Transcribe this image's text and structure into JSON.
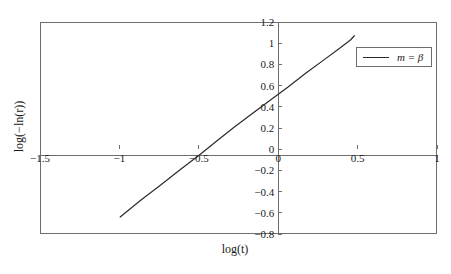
{
  "chart_data": {
    "type": "line",
    "title": "",
    "xlabel": "log(t)",
    "ylabel": "log(−ln(r))",
    "xlim": [
      -1.5,
      1.0
    ],
    "ylim": [
      -0.8,
      1.2
    ],
    "grid": false,
    "axes_through_origin": true,
    "legend": {
      "position": "upper-right-inside",
      "entries": [
        {
          "name": "m = β",
          "color": "#2b2b2b",
          "style": "solid-line"
        }
      ]
    },
    "xticks": [
      {
        "value": -1.5,
        "label": "−1.5"
      },
      {
        "value": -1.0,
        "label": "−1"
      },
      {
        "value": -0.5,
        "label": "−0.5"
      },
      {
        "value": 0.0,
        "label": "0"
      },
      {
        "value": 0.5,
        "label": "0.5"
      },
      {
        "value": 1.0,
        "label": "1"
      }
    ],
    "yticks": [
      {
        "value": 1.2,
        "label": "1.2"
      },
      {
        "value": 1.0,
        "label": "1"
      },
      {
        "value": 0.8,
        "label": "0.8"
      },
      {
        "value": 0.6,
        "label": "0.6"
      },
      {
        "value": 0.4,
        "label": "0.4"
      },
      {
        "value": 0.2,
        "label": "0.2"
      },
      {
        "value": 0.0,
        "label": "0"
      },
      {
        "value": -0.2,
        "label": "−0.2"
      },
      {
        "value": -0.4,
        "label": "−0.4"
      },
      {
        "value": -0.6,
        "label": "−0.6"
      },
      {
        "value": -0.8,
        "label": "−0.8"
      }
    ],
    "series": [
      {
        "name": "m = β",
        "color": "#2b2b2b",
        "x": [
          -0.995,
          -0.87,
          -0.74,
          -0.61,
          -0.5,
          -0.395,
          -0.28,
          -0.165,
          -0.055,
          0.06,
          0.175,
          0.29,
          0.385,
          0.455,
          0.48
        ],
        "y": [
          -0.64,
          -0.487,
          -0.338,
          -0.185,
          -0.06,
          0.068,
          0.205,
          0.335,
          0.458,
          0.585,
          0.718,
          0.845,
          0.95,
          1.03,
          1.07
        ]
      }
    ]
  },
  "axis_titles": {
    "x": "log(t)",
    "y": "log(−ln(r))"
  },
  "legend": {
    "label": "m = β"
  },
  "caption": {
    "text": ""
  }
}
